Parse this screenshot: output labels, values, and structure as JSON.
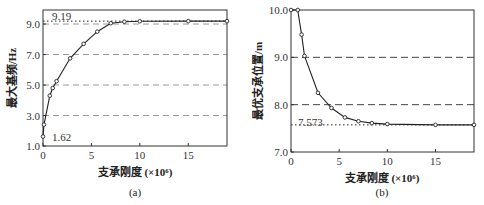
{
  "chart_data": [
    {
      "id": "a",
      "type": "line",
      "caption": "(a)",
      "xlabel": "支承刚度 (×10⁶)",
      "ylabel": "最大基频/Hz",
      "xlim": [
        0,
        19
      ],
      "ylim": [
        1.0,
        9.92
      ],
      "xticks": [
        0,
        5,
        10,
        15
      ],
      "xtick_labels": [
        "0",
        "5",
        "10",
        "15"
      ],
      "yticks": [
        1.0,
        3.0,
        5.0,
        7.0,
        9.0
      ],
      "ytick_labels": [
        "1.0",
        "3.0",
        "5.0",
        "7.0",
        "9.0"
      ],
      "grid": "horizontal dashed at 3.0, 5.0, 7.0, 9.0",
      "gridlines": [
        3.0,
        5.0,
        7.0,
        9.0
      ],
      "reference_line": {
        "y": 9.19,
        "style": "dotted",
        "label": "9.19"
      },
      "annotations": [
        {
          "text": "9.19",
          "x": 0.8,
          "y": 9.19
        },
        {
          "text": "1.62",
          "x": 0.8,
          "y": 1.62
        }
      ],
      "series": [
        {
          "name": "最大基频",
          "x": [
            0,
            0.1,
            0.7,
            1.0,
            1.4,
            2.8,
            4.2,
            5.6,
            7.0,
            8.4,
            10,
            15,
            19
          ],
          "y": [
            1.62,
            2.4,
            4.3,
            4.8,
            5.25,
            6.75,
            7.7,
            8.5,
            9.05,
            9.15,
            9.18,
            9.19,
            9.19
          ]
        }
      ]
    },
    {
      "id": "b",
      "type": "line",
      "caption": "(b)",
      "xlabel": "支承刚度 (×10⁶)",
      "ylabel": "最优支承位置/m",
      "xlim": [
        0,
        19
      ],
      "ylim": [
        7.0,
        10.0
      ],
      "xticks": [
        0,
        5,
        10,
        15
      ],
      "xtick_labels": [
        "0",
        "5",
        "10",
        "15"
      ],
      "yticks": [
        7.0,
        8.0,
        9.0,
        10.0
      ],
      "ytick_labels": [
        "7.0",
        "8.0",
        "9.0",
        "10.0"
      ],
      "grid": "horizontal dashed at 8.0, 9.0",
      "gridlines": [
        8.0,
        9.0
      ],
      "reference_line": {
        "y": 7.573,
        "style": "dotted",
        "label": "7.573"
      },
      "annotations": [
        {
          "text": "7.573",
          "x": 0.9,
          "y": 7.573
        }
      ],
      "series": [
        {
          "name": "最优支承位置",
          "x": [
            0,
            0.7,
            1.1,
            1.4,
            2.8,
            4.2,
            5.6,
            7.0,
            8.4,
            10,
            15,
            19
          ],
          "y": [
            10.0,
            10.0,
            9.48,
            9.03,
            8.25,
            7.93,
            7.73,
            7.65,
            7.61,
            7.59,
            7.573,
            7.573
          ]
        }
      ]
    }
  ]
}
